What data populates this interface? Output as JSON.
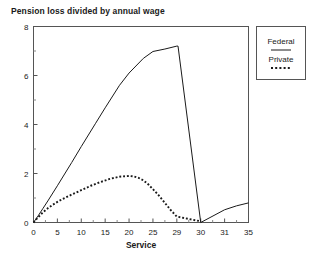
{
  "chart_data": {
    "type": "line",
    "title": "Pension loss divided by annual wage",
    "xlabel": "Service",
    "ylabel": "",
    "xticklabels": [
      "0",
      "5",
      "10",
      "15",
      "20",
      "25",
      "29",
      "30",
      "31",
      "35"
    ],
    "xtickvalues": [
      0,
      5,
      10,
      15,
      20,
      25,
      29,
      30,
      31,
      35
    ],
    "yticklabels": [
      "0",
      "2",
      "4",
      "6",
      "8"
    ],
    "ytickvalues": [
      0,
      2,
      4,
      6,
      8
    ],
    "ylim": [
      0,
      8
    ],
    "xlim": [
      0,
      35
    ],
    "grid": false,
    "minor_ticks": true,
    "legend_position": "outside-top-right",
    "series": [
      {
        "name": "Federal",
        "style": "solid",
        "color": "#1a1a1a",
        "x": [
          0,
          1,
          2,
          3,
          5,
          8,
          10,
          13,
          15,
          18,
          20,
          23,
          25,
          27,
          29,
          29.05,
          30,
          31,
          33,
          35
        ],
        "values": [
          0,
          0.28,
          0.58,
          0.88,
          1.5,
          2.45,
          3.1,
          4.05,
          4.68,
          5.6,
          6.1,
          6.7,
          6.98,
          7.08,
          7.2,
          7.2,
          0,
          0.52,
          0.68,
          0.8
        ]
      },
      {
        "name": "Private",
        "style": "dotted",
        "color": "#1a1a1a",
        "x": [
          0,
          1,
          2,
          3,
          4,
          5,
          6,
          8,
          10,
          12,
          14,
          16,
          18,
          20,
          21,
          22,
          23,
          24,
          25,
          26,
          27,
          28,
          29,
          30
        ],
        "values": [
          0,
          0.22,
          0.42,
          0.58,
          0.72,
          0.84,
          0.95,
          1.14,
          1.32,
          1.5,
          1.65,
          1.78,
          1.87,
          1.9,
          1.88,
          1.82,
          1.72,
          1.56,
          1.36,
          1.1,
          0.8,
          0.5,
          0.24,
          0.05
        ]
      }
    ]
  },
  "legend": {
    "entries": [
      {
        "label": "Federal",
        "style": "solid"
      },
      {
        "label": "Private",
        "style": "dotted"
      }
    ]
  }
}
